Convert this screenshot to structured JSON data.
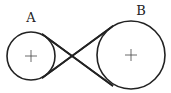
{
  "diagram": {
    "title": "",
    "type": "crossed belt pulley diagram",
    "pulleys": [
      {
        "label": "A",
        "cx": 31,
        "cy": 56,
        "r": 24
      },
      {
        "label": "B",
        "cx": 131,
        "cy": 55,
        "r": 34
      }
    ],
    "belt": "crossed",
    "colors": {
      "stroke": "#222222",
      "background": "#ffffff"
    }
  }
}
